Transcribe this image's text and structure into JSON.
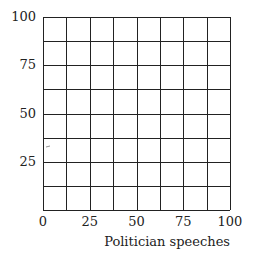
{
  "chart_data": {
    "type": "scatter",
    "title": "",
    "xlabel": "Politician speeches",
    "ylabel": "",
    "xlim": [
      0,
      100
    ],
    "ylim": [
      0,
      100
    ],
    "x_ticks": [
      "0",
      "25",
      "50",
      "75",
      "100"
    ],
    "y_ticks": [
      "25",
      "50",
      "75",
      "100"
    ],
    "grid": true,
    "grid_step": 12.5,
    "series": [],
    "legend": null
  },
  "colors": {
    "grid": "#222222",
    "text": "#222222",
    "background": "#ffffff"
  }
}
